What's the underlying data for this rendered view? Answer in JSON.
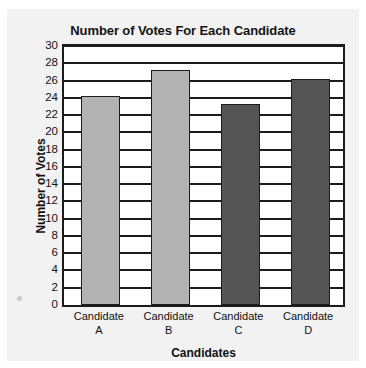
{
  "chart_data": {
    "type": "bar",
    "title": "Number of Votes For Each Candidate",
    "xlabel": "Candidates",
    "ylabel": "Number of Votes",
    "categories": [
      "Candidate A",
      "Candidate B",
      "Candidate C",
      "Candidate D"
    ],
    "category_lines": [
      [
        "Candidate",
        "A"
      ],
      [
        "Candidate",
        "B"
      ],
      [
        "Candidate",
        "C"
      ],
      [
        "Candidate",
        "D"
      ]
    ],
    "values": [
      24,
      27,
      23,
      26
    ],
    "bar_colors": [
      "#b3b3b3",
      "#b3b3b3",
      "#545454",
      "#545454"
    ],
    "ylim": [
      0,
      30
    ],
    "ytick_step": 2,
    "yticks": [
      0,
      2,
      4,
      6,
      8,
      10,
      12,
      14,
      16,
      18,
      20,
      22,
      24,
      26,
      28,
      30
    ],
    "ytick_labels": [
      "0",
      "2",
      "4",
      "6",
      "8",
      "10",
      "12",
      "14",
      "16",
      "18",
      "20",
      "22",
      "24",
      "26",
      "28",
      "30"
    ],
    "grid": true,
    "grid_axis": "y",
    "legend": false,
    "axis_color": "#1c1c1c",
    "plot_background": "#ffffff",
    "figure_background": "#f2f2f2"
  }
}
